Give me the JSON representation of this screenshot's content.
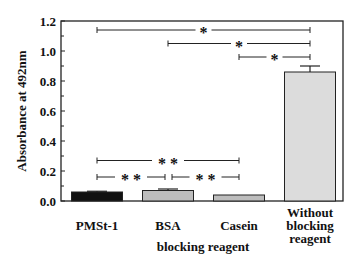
{
  "chart_data": {
    "type": "bar",
    "title": "",
    "xlabel": "blocking reagent",
    "ylabel": "Absorbance at 492nm",
    "ylim": [
      0,
      1.2
    ],
    "yticks": [
      "0.0",
      "0.2",
      "0.4",
      "0.6",
      "0.8",
      "1.0",
      "1.2"
    ],
    "grid": false,
    "categories": [
      "PMSt-1",
      "BSA",
      "Casein",
      "Without blocking reagent"
    ],
    "category_lines": [
      [
        "PMSt-1"
      ],
      [
        "BSA"
      ],
      [
        "Casein"
      ],
      [
        "Without",
        "blocking",
        "reagent"
      ]
    ],
    "values": [
      0.06,
      0.07,
      0.04,
      0.86
    ],
    "errors": [
      0.005,
      0.01,
      0.0,
      0.04
    ],
    "bar_colors": [
      "#111111",
      "#bdbdbd",
      "#bdbdbd",
      "#dcdcdc"
    ],
    "significance": [
      {
        "from": 0,
        "to": 3,
        "label": "*",
        "y": 1.14
      },
      {
        "from": 1,
        "to": 3,
        "label": "*",
        "y": 1.05
      },
      {
        "from": 2,
        "to": 3,
        "label": "*",
        "y": 0.96
      },
      {
        "from": 0,
        "to": 2,
        "label": "**",
        "y": 0.27
      },
      {
        "from": 0,
        "to": 1,
        "label": "**",
        "y": 0.16
      },
      {
        "from": 1,
        "to": 2,
        "label": "**",
        "y": 0.16
      }
    ]
  }
}
